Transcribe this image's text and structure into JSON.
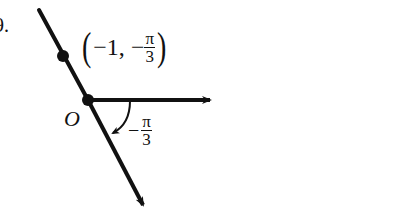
{
  "problem_number": "9.",
  "diagram": {
    "type": "polar-coordinates",
    "origin_label": "O",
    "point_label": {
      "open": "(",
      "r": "−1,",
      "theta_sign": "−",
      "theta_num": "π",
      "theta_den": "3",
      "close": ")"
    },
    "angle_label": {
      "sign": "−",
      "num": "π",
      "den": "3"
    },
    "colors": {
      "ink": "#111111",
      "background": "#ffffff"
    }
  }
}
